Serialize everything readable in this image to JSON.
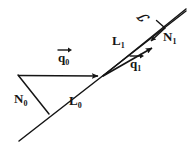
{
  "figure": {
    "name": "wavefront-refraction-diagram",
    "background_color": "#ffffff",
    "stroke_color": "#151515",
    "width": 193,
    "height": 147
  },
  "labels": {
    "q0": {
      "text": "q",
      "subscript": "0",
      "description": "incident ray direction vector q-zero",
      "has_vector_arrow": true
    },
    "q1": {
      "text": "q",
      "subscript": "1",
      "description": "refracted ray direction vector q-one",
      "has_vector_arrow": true
    },
    "N0": {
      "text": "N",
      "subscript": "0",
      "description": "surface normal N-zero",
      "has_vector_arrow": false
    },
    "N1": {
      "text": "N",
      "subscript": "1",
      "description": "surface normal N-one",
      "has_vector_arrow": false
    },
    "L0": {
      "text": "L",
      "subscript": "0",
      "description": "wavefront line L-zero",
      "has_vector_arrow": false
    },
    "L1": {
      "text": "L",
      "subscript": "1",
      "description": "wavefront line L-one",
      "has_vector_arrow": false
    },
    "surface": {
      "text": "ℐ",
      "subscript": "",
      "description": "script S denoting the optical surface",
      "has_vector_arrow": false
    }
  },
  "geometry": {
    "vertex": {
      "x": 103,
      "y": 76
    },
    "line_L0": {
      "x1": 19,
      "y1": 141,
      "x2": 186,
      "y2": 11
    },
    "line_L1": {
      "x1": 103,
      "y1": 76,
      "x2": 186,
      "y2": 9
    },
    "arrow_q0": {
      "x1": 18,
      "y1": 75,
      "x2": 101,
      "y2": 76
    },
    "arrow_q1": {
      "x1": 103,
      "y1": 76,
      "x2": 156,
      "y2": 46
    },
    "line_N0": {
      "x1": 18,
      "y1": 75,
      "x2": 49,
      "y2": 114
    },
    "arrow_N1": {
      "x1": 164,
      "y1": 27,
      "x2": 148,
      "y2": 42
    },
    "tick_N1": {
      "x1": 156,
      "y1": 20,
      "x2": 164,
      "y2": 27
    }
  }
}
